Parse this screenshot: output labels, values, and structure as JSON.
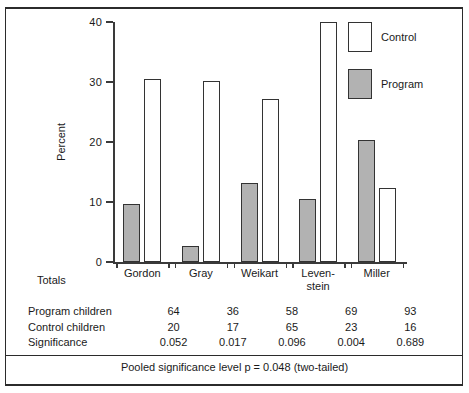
{
  "figure": {
    "ylabel": "Percent",
    "totals_label": "Totals",
    "footer": "Pooled significance level p  =  0.048 (two-tailed)",
    "clipped_header": ""
  },
  "legend": {
    "position": "top-right",
    "items": [
      {
        "label": "Control",
        "color": "#ffffff",
        "key": "control"
      },
      {
        "label": "Program",
        "color": "#b2b2b2",
        "key": "program"
      }
    ]
  },
  "table": {
    "rows": [
      {
        "header": "Program children",
        "values": [
          "64",
          "36",
          "58",
          "69",
          "93"
        ]
      },
      {
        "header": "Control children",
        "values": [
          "20",
          "17",
          "65",
          "23",
          "16"
        ]
      },
      {
        "header": "Significance",
        "values": [
          "0.052",
          "0.017",
          "0.096",
          "0.004",
          "0.689"
        ]
      }
    ]
  },
  "chart_data": {
    "type": "bar",
    "title": "",
    "xlabel": "",
    "ylabel": "Percent",
    "ylim": [
      0,
      40
    ],
    "yticks": [
      0,
      10,
      20,
      30,
      40
    ],
    "ytick_labels": [
      "0",
      "10",
      "20",
      "30",
      "40"
    ],
    "grid": false,
    "legend_position": "top-right",
    "categories": [
      "Gordon",
      "Gray",
      "Weikart",
      "Leven-\nstein",
      "Miller"
    ],
    "category_labels_flat": [
      "Gordon",
      "Gray",
      "Weikart",
      "Leven-stein",
      "Miller"
    ],
    "series": [
      {
        "name": "Program",
        "color": "#b2b2b2",
        "values": [
          9.6,
          2.7,
          13.1,
          10.5,
          20.3
        ]
      },
      {
        "name": "Control",
        "color": "#ffffff",
        "values": [
          30.5,
          30.2,
          27.1,
          40.0,
          12.3
        ]
      }
    ],
    "annotations": {
      "pooled_significance": "Pooled significance level p  =  0.048 (two-tailed)",
      "program_children": [
        64,
        36,
        58,
        69,
        93
      ],
      "control_children": [
        20,
        17,
        65,
        23,
        16
      ],
      "significance": [
        0.052,
        0.017,
        0.096,
        0.004,
        0.689
      ]
    }
  }
}
